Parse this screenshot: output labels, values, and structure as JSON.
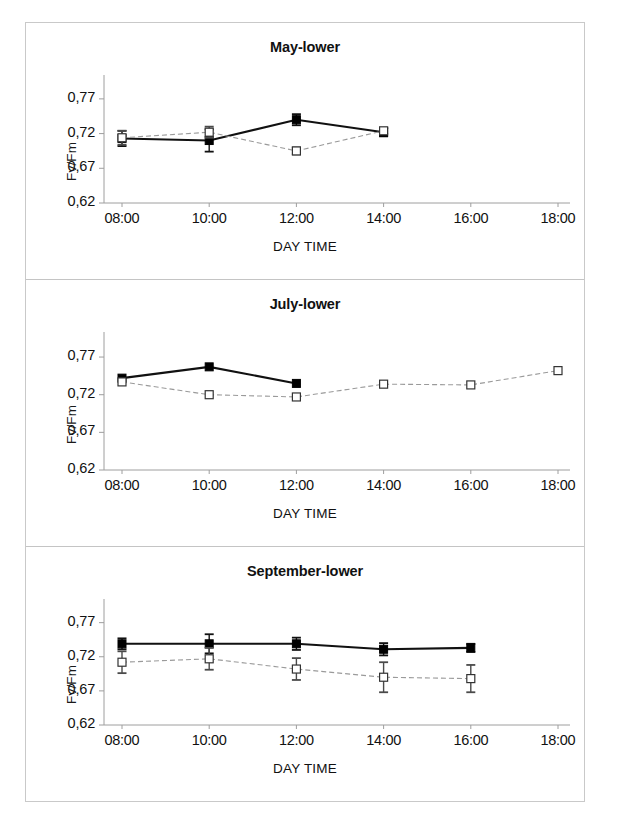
{
  "figure": {
    "axis_label_y": "Fv/Fm",
    "axis_label_x": "DAY TIME",
    "y_ticks": [
      "0,77",
      "0,72",
      "0,67",
      "0,62"
    ],
    "x_ticks": [
      "08:00",
      "10:00",
      "12:00",
      "14:00",
      "16:00",
      "18:00"
    ],
    "series_names": [
      "filled-square-series",
      "open-square-series"
    ],
    "colors": {
      "filled_marker": "#000000",
      "open_marker_fill": "#ffffff",
      "open_marker_stroke": "#333333",
      "filled_line": "#111111",
      "open_line": "#9a9a9a",
      "axis": "#9e9e9e",
      "border": "#c9c9c9",
      "text": "#111111"
    }
  },
  "chart_data": [
    {
      "type": "line",
      "title": "May-lower",
      "xlabel": "DAY TIME",
      "ylabel": "Fv/Fm",
      "x": [
        "08:00",
        "10:00",
        "12:00",
        "14:00",
        "16:00",
        "18:00"
      ],
      "ylim": [
        0.62,
        0.79
      ],
      "yticks": [
        0.62,
        0.67,
        0.72,
        0.77
      ],
      "ytick_labels": [
        "0,62",
        "0,67",
        "0,72",
        "0,77"
      ],
      "grid": false,
      "legend": "none",
      "series": [
        {
          "name": "filled-square-series",
          "marker": "filled-square",
          "x": [
            "08:00",
            "10:00",
            "12:00",
            "14:00"
          ],
          "values": [
            0.713,
            0.71,
            0.74,
            0.722
          ],
          "errors": [
            0.011,
            0.016,
            0.008,
            0.006
          ]
        },
        {
          "name": "open-square-series",
          "marker": "open-square",
          "x": [
            "08:00",
            "10:00",
            "12:00",
            "14:00"
          ],
          "values": [
            0.714,
            0.722,
            0.695,
            0.724
          ],
          "errors": [
            0.01,
            0.008,
            0.005,
            0.004
          ]
        }
      ]
    },
    {
      "type": "line",
      "title": "July-lower",
      "xlabel": "DAY TIME",
      "ylabel": "Fv/Fm",
      "x": [
        "08:00",
        "10:00",
        "12:00",
        "14:00",
        "16:00",
        "18:00"
      ],
      "ylim": [
        0.62,
        0.79
      ],
      "yticks": [
        0.62,
        0.67,
        0.72,
        0.77
      ],
      "ytick_labels": [
        "0,62",
        "0,67",
        "0,72",
        "0,77"
      ],
      "grid": false,
      "legend": "none",
      "series": [
        {
          "name": "filled-square-series",
          "marker": "filled-square",
          "x": [
            "08:00",
            "10:00",
            "12:00"
          ],
          "values": [
            0.742,
            0.757,
            0.735
          ],
          "errors": [
            0.0,
            0.0,
            0.0
          ]
        },
        {
          "name": "open-square-series",
          "marker": "open-square",
          "x": [
            "08:00",
            "10:00",
            "12:00",
            "14:00",
            "16:00",
            "18:00"
          ],
          "values": [
            0.737,
            0.72,
            0.717,
            0.734,
            0.733,
            0.752
          ],
          "errors": [
            0.0,
            0.0,
            0.0,
            0.0,
            0.0,
            0.0
          ]
        }
      ]
    },
    {
      "type": "line",
      "title": "September-lower",
      "xlabel": "DAY TIME",
      "ylabel": "Fv/Fm",
      "x": [
        "08:00",
        "10:00",
        "12:00",
        "14:00",
        "16:00",
        "18:00"
      ],
      "ylim": [
        0.62,
        0.79
      ],
      "yticks": [
        0.62,
        0.67,
        0.72,
        0.77
      ],
      "ytick_labels": [
        "0,62",
        "0,67",
        "0,72",
        "0,77"
      ],
      "grid": false,
      "legend": "none",
      "series": [
        {
          "name": "filled-square-series",
          "marker": "filled-square",
          "x": [
            "08:00",
            "10:00",
            "12:00",
            "14:00",
            "16:00"
          ],
          "values": [
            0.739,
            0.739,
            0.739,
            0.731,
            0.733
          ],
          "errors": [
            0.008,
            0.014,
            0.009,
            0.009,
            0.006
          ]
        },
        {
          "name": "open-square-series",
          "marker": "open-square",
          "x": [
            "08:00",
            "10:00",
            "12:00",
            "14:00",
            "16:00"
          ],
          "values": [
            0.712,
            0.717,
            0.702,
            0.69,
            0.688
          ],
          "errors": [
            0.016,
            0.016,
            0.016,
            0.022,
            0.02
          ]
        }
      ]
    }
  ]
}
